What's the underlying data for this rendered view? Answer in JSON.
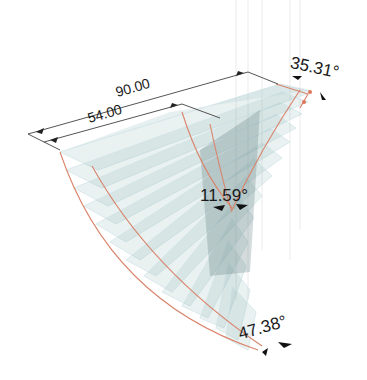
{
  "diagram": {
    "type": "3d-twisted-surface",
    "colors": {
      "plane_fill": "#7fa6ab",
      "plane_edge": "#cfe3e6",
      "curve": "#d9836a",
      "dimension_line": "#555555",
      "text": "#1a1a1a"
    },
    "dimensions": [
      {
        "id": "outer-length",
        "label": "90.00"
      },
      {
        "id": "inner-length",
        "label": "54.00"
      }
    ],
    "angles": [
      {
        "id": "top-right-angle",
        "label": "35.31°"
      },
      {
        "id": "middle-angle",
        "label": "11.59°"
      },
      {
        "id": "bottom-angle",
        "label": "47.38°"
      }
    ]
  }
}
